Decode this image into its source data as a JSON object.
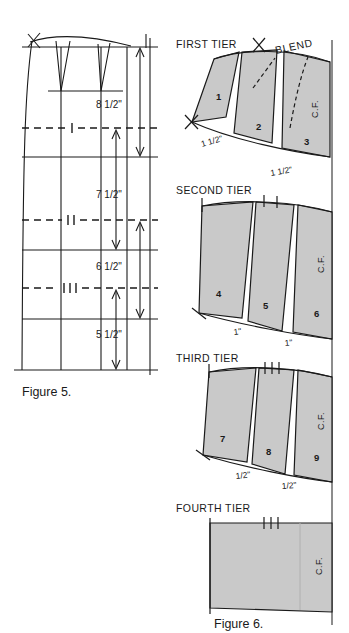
{
  "page": {
    "background": "#ffffff",
    "ink": "#1a1a1a",
    "piece_fill": "#c9c9c9",
    "width": 349,
    "height": 633
  },
  "figure5": {
    "caption": "Figure 5.",
    "vertical_dimensions": [
      {
        "id": "dim-8-5",
        "label": "8 1/2\""
      },
      {
        "id": "dim-7-5",
        "label": "7 1/2\""
      },
      {
        "id": "dim-6-5",
        "label": "6 1/2\""
      },
      {
        "id": "dim-5-5",
        "label": "5 1/2\""
      }
    ],
    "tier_marks": [
      {
        "id": "mark-1",
        "label": "I"
      },
      {
        "id": "mark-2",
        "label": "II"
      },
      {
        "id": "mark-3",
        "label": "III"
      }
    ]
  },
  "figure6": {
    "caption": "Figure 6.",
    "blend_label": "BLEND",
    "tiers": [
      {
        "name": "FIRST TIER",
        "center_front": "C.F.",
        "pieces": [
          "1",
          "2",
          "3"
        ],
        "spread_labels": [
          "1 1/2\"",
          "1 1/2\""
        ],
        "notches": 1
      },
      {
        "name": "SECOND TIER",
        "center_front": "C.F.",
        "pieces": [
          "4",
          "5",
          "6"
        ],
        "spread_labels": [
          "1\"",
          "1\""
        ],
        "notches": 2
      },
      {
        "name": "THIRD TIER",
        "center_front": "C.F.",
        "pieces": [
          "7",
          "8",
          "9"
        ],
        "spread_labels": [
          "1/2\"",
          "1/2\""
        ],
        "notches": 3
      },
      {
        "name": "FOURTH TIER",
        "center_front": "C.F.",
        "pieces": [],
        "spread_labels": [],
        "notches": 3
      }
    ]
  }
}
